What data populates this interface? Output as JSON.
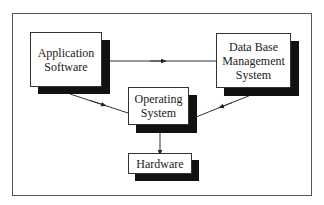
{
  "diagram": {
    "type": "block-diagram",
    "nodes": [
      {
        "id": "app",
        "lines": [
          "Application",
          "Software"
        ]
      },
      {
        "id": "dbms",
        "lines": [
          "Data Base",
          "Management",
          "System"
        ]
      },
      {
        "id": "os",
        "lines": [
          "Operating",
          "System"
        ]
      },
      {
        "id": "hw",
        "lines": [
          "Hardware"
        ]
      }
    ],
    "edges": [
      {
        "from": "Application Software",
        "to": "Data Base Management System"
      },
      {
        "from": "Application Software",
        "to": "Operating System"
      },
      {
        "from": "Data Base Management System",
        "to": "Operating System"
      },
      {
        "from": "Operating System",
        "to": "Hardware"
      }
    ],
    "colors": {
      "line": "#333333",
      "shadow": "#111111",
      "box_fill": "#ffffff",
      "frame": "#555555"
    }
  }
}
